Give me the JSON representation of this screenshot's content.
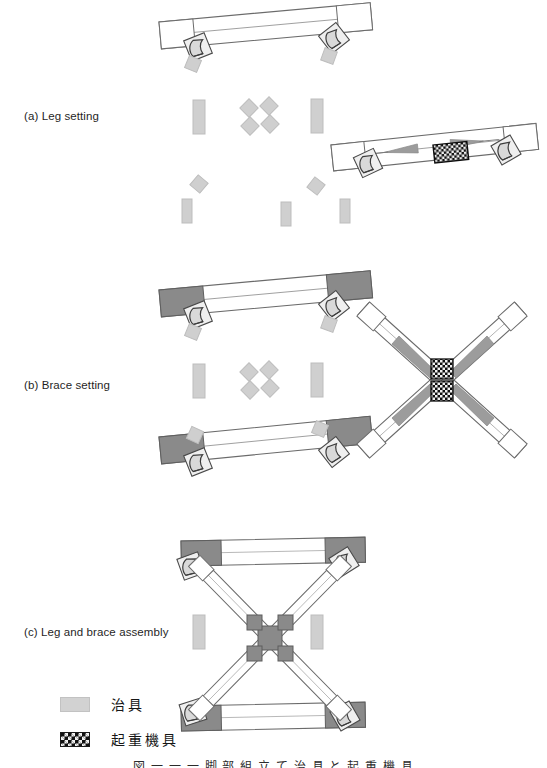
{
  "figure": {
    "caption": "図 一 一 一 脚 部 組 立 て 治 具 と 起 重 機 具",
    "panels": [
      {
        "id": "a",
        "label": "(a) Leg setting"
      },
      {
        "id": "b",
        "label": "(b) Brace setting"
      },
      {
        "id": "c",
        "label": "(c) Leg and brace assembly"
      }
    ]
  },
  "legend": {
    "items": [
      {
        "key": "jig",
        "swatch": "light-gray-block",
        "label": "治具"
      },
      {
        "key": "crane",
        "swatch": "checkerboard-block",
        "label": "起重機具"
      }
    ]
  },
  "colors": {
    "outline": "#5a5a5a",
    "member_fill": "#ffffff",
    "shaded_end": "#8a8a8a",
    "jig_fill": "#cfcfcf",
    "jig_stroke": "#bdbdbd",
    "sling_fill": "#9c9c9c",
    "crane_dark": "#121212",
    "crane_light": "#f4f4f4",
    "joint_fill": "#efefef",
    "text": "#1f1f1f",
    "background": "#ffffff"
  },
  "diagram": {
    "type": "assembly-procedure-diagram",
    "panel_a": {
      "name": "Leg setting",
      "elements": [
        {
          "name": "leg-member-upper",
          "kind": "leg",
          "state": "plain",
          "angle_deg": -5.5
        },
        {
          "name": "leg-member-lower-right",
          "kind": "leg",
          "state": "with-lifting-gear",
          "angle_deg": -6.0
        },
        {
          "name": "jig-group-left",
          "count": 1
        },
        {
          "name": "jig-group-center-diamond",
          "count": 4
        },
        {
          "name": "jig-group-right",
          "count": 1
        },
        {
          "name": "jig-group-lower",
          "count": 5
        },
        {
          "name": "lifting-gear-block",
          "count": 1
        }
      ]
    },
    "panel_b": {
      "name": "Brace setting",
      "elements": [
        {
          "name": "leg-member-upper",
          "kind": "leg",
          "state": "shaded-ends",
          "angle_deg": -5.5
        },
        {
          "name": "leg-member-lower",
          "kind": "leg",
          "state": "shaded-ends",
          "angle_deg": -6.0
        },
        {
          "name": "brace-cross-assembly",
          "kind": "brace-x",
          "state": "slung"
        },
        {
          "name": "jig-group-left",
          "count": 1
        },
        {
          "name": "jig-group-center-diamond",
          "count": 4
        },
        {
          "name": "jig-group-right",
          "count": 1
        },
        {
          "name": "lifting-gear-block",
          "count": 2
        }
      ]
    },
    "panel_c": {
      "name": "Leg and brace assembly",
      "elements": [
        {
          "name": "leg-member-top",
          "kind": "leg",
          "state": "shaded-ends"
        },
        {
          "name": "leg-member-bottom",
          "kind": "leg",
          "state": "shaded-ends"
        },
        {
          "name": "brace-diagonal-a",
          "kind": "brace"
        },
        {
          "name": "brace-diagonal-b",
          "kind": "brace"
        },
        {
          "name": "center-gusset",
          "kind": "joint"
        },
        {
          "name": "jig-left",
          "count": 1
        },
        {
          "name": "jig-right",
          "count": 1
        }
      ]
    }
  }
}
